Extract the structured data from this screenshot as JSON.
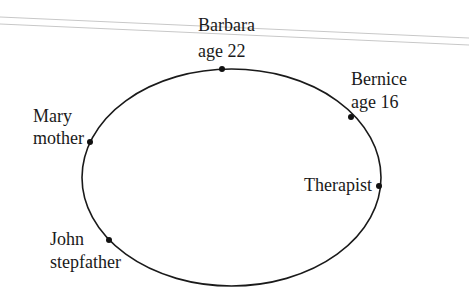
{
  "diagram": {
    "type": "relationship-circle",
    "ellipse": {
      "cx": 231.5,
      "cy": 177.5,
      "rx": 149.5,
      "ry": 108.5,
      "stroke": "#1a1a1a"
    },
    "header_lines": {
      "color": "#c8c8c8"
    },
    "nodes": [
      {
        "name": "Barbara",
        "role": "age 22",
        "dot": [
          222,
          69
        ]
      },
      {
        "name": "Bernice",
        "role": "age 16",
        "dot": [
          351,
          117
        ]
      },
      {
        "name": "Mary",
        "role": "mother",
        "dot": [
          90,
          142
        ]
      },
      {
        "name": "Therapist",
        "role": "",
        "dot": [
          379,
          186
        ]
      },
      {
        "name": "John",
        "role": "stepfather",
        "dot": [
          109,
          240
        ]
      }
    ]
  }
}
